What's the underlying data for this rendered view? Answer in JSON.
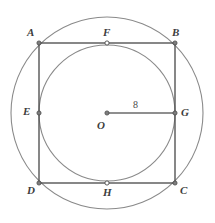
{
  "figure": {
    "canvas": {
      "width": 215,
      "height": 223
    },
    "colors": {
      "square_stroke": "#555555",
      "circle_stroke": "#8a8a8a",
      "radius_stroke": "#6a6a6a",
      "point_fill": "#7d7d7d",
      "point_stroke": "#4a4a4a",
      "label_color": "#3d3d3d",
      "background": "#ffffff"
    },
    "outer_circle": {
      "cx": 107,
      "cy": 113,
      "r": 96
    },
    "inner_circle": {
      "cx": 107,
      "cy": 113,
      "r": 68
    },
    "square": {
      "vertices": [
        {
          "name": "A",
          "x": 39,
          "y": 43
        },
        {
          "name": "B",
          "x": 175,
          "y": 43
        },
        {
          "name": "C",
          "x": 175,
          "y": 183
        },
        {
          "name": "D",
          "x": 39,
          "y": 183
        }
      ]
    },
    "points": [
      {
        "label": "A",
        "x": 39,
        "y": 43,
        "lx": 27,
        "ly": 27
      },
      {
        "label": "B",
        "x": 175,
        "y": 43,
        "lx": 172,
        "ly": 27
      },
      {
        "label": "C",
        "x": 175,
        "y": 183,
        "lx": 180,
        "ly": 185
      },
      {
        "label": "D",
        "x": 39,
        "y": 183,
        "lx": 27,
        "ly": 185
      },
      {
        "label": "E",
        "x": 39,
        "y": 113,
        "lx": 23,
        "ly": 106
      },
      {
        "label": "F",
        "x": 107,
        "y": 43,
        "lx": 103,
        "ly": 27
      },
      {
        "label": "G",
        "x": 175,
        "y": 113,
        "lx": 181,
        "ly": 107
      },
      {
        "label": "H",
        "x": 107,
        "y": 183,
        "lx": 103,
        "ly": 187
      },
      {
        "label": "O",
        "x": 107,
        "y": 113,
        "lx": 97,
        "ly": 120
      }
    ],
    "radius_segment": {
      "from": "O",
      "to": "G",
      "x1": 107,
      "y1": 113,
      "x2": 175,
      "y2": 113,
      "length_label": "8",
      "label_x": 133,
      "label_y": 100
    }
  }
}
